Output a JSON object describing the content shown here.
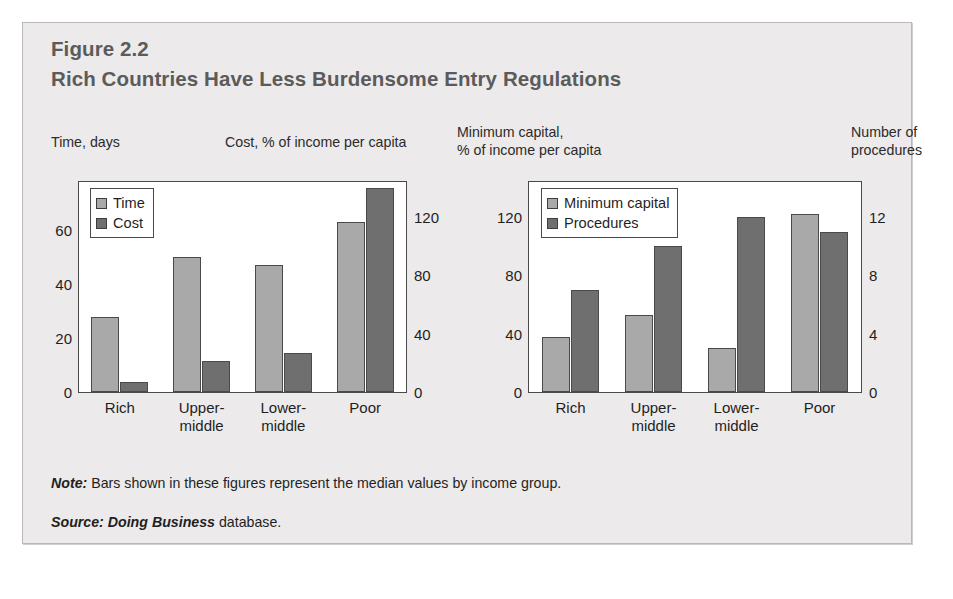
{
  "figure": {
    "number": "Figure 2.2",
    "title": "Rich Countries Have Less Burdensome Entry Regulations",
    "note_prefix": "Note:",
    "note_text": " Bars shown in these figures represent the median values by income group.",
    "source_prefix": "Source:",
    "source_em": " Doing Business",
    "source_text": " database."
  },
  "colors": {
    "light_bar": "#a9a9a9",
    "dark_bar": "#6f6f6f",
    "panel_border": "#4a4a4a",
    "figure_bg": "#eceaea",
    "title_text": "#5b5b5b"
  },
  "captions": {
    "left_primary": "Time, days",
    "left_secondary": "Cost, % of income per capita",
    "right_primary": "Minimum capital,\n% of income per capita",
    "right_secondary": "Number of\nprocedures"
  },
  "chart_data": [
    {
      "type": "bar",
      "id": "left",
      "title": "Time and Cost of Entry Regulation by Income Group",
      "categories": [
        "Rich",
        "Upper-\nmiddle",
        "Lower-\nmiddle",
        "Poor"
      ],
      "xlabel": "",
      "grid": false,
      "legend_position": "top-left",
      "series": [
        {
          "name": "Time",
          "axis": "left",
          "unit": "days",
          "color": "#a9a9a9",
          "values": [
            28,
            50,
            47,
            63
          ]
        },
        {
          "name": "Cost",
          "axis": "right",
          "unit": "% of income per capita",
          "color": "#6f6f6f",
          "values": [
            7,
            21,
            27,
            140
          ]
        }
      ],
      "axes": {
        "left": {
          "label": "Time, days",
          "ticks": [
            0,
            20,
            40,
            60
          ],
          "tick_labels": [
            "0",
            "20",
            "40",
            "60"
          ],
          "ylim": [
            0,
            78
          ]
        },
        "right": {
          "label": "Cost, % of income per capita",
          "ticks": [
            0,
            40,
            80,
            120
          ],
          "tick_labels": [
            "0",
            "40",
            "80",
            "120"
          ],
          "ylim": [
            0,
            144
          ]
        }
      }
    },
    {
      "type": "bar",
      "id": "right",
      "title": "Minimum Capital and Number of Procedures by Income Group",
      "categories": [
        "Rich",
        "Upper-\nmiddle",
        "Lower-\nmiddle",
        "Poor"
      ],
      "xlabel": "",
      "grid": false,
      "legend_position": "top-left",
      "series": [
        {
          "name": "Minimum capital",
          "axis": "left",
          "unit": "% of income per capita",
          "color": "#a9a9a9",
          "values": [
            38,
            53,
            30,
            122
          ]
        },
        {
          "name": "Procedures",
          "axis": "right",
          "unit": "number",
          "color": "#6f6f6f",
          "values": [
            7,
            10,
            12,
            11
          ]
        }
      ],
      "axes": {
        "left": {
          "label": "Minimum capital, % of income per capita",
          "ticks": [
            0,
            40,
            80,
            120
          ],
          "tick_labels": [
            "0",
            "40",
            "80",
            "120"
          ],
          "ylim": [
            0,
            144
          ]
        },
        "right": {
          "label": "Number of procedures",
          "ticks": [
            0,
            4,
            8,
            12
          ],
          "tick_labels": [
            "0",
            "4",
            "8",
            "12"
          ],
          "ylim": [
            0,
            14.4
          ]
        }
      }
    }
  ]
}
